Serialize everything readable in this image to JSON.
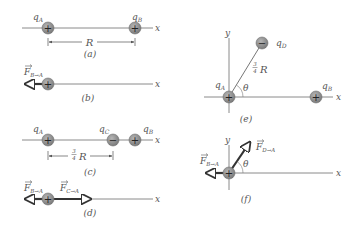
{
  "panels": {
    "a": {
      "caption": "(a)",
      "axis_label": "x",
      "charges": [
        {
          "name": "q",
          "sub": "A",
          "sign": "+"
        },
        {
          "name": "q",
          "sub": "B",
          "sign": "+"
        }
      ],
      "distance_label": "R"
    },
    "b": {
      "caption": "(b)",
      "axis_label": "x",
      "charge": {
        "sign": "+"
      },
      "force": {
        "name": "F",
        "sub": "B→A"
      }
    },
    "c": {
      "caption": "(c)",
      "axis_label": "x",
      "charges": [
        {
          "name": "q",
          "sub": "A",
          "sign": "+"
        },
        {
          "name": "q",
          "sub": "C",
          "sign": "−"
        },
        {
          "name": "q",
          "sub": "B",
          "sign": "+"
        }
      ],
      "distance_num": "3",
      "distance_den": "4",
      "distance_label": "R"
    },
    "d": {
      "caption": "(d)",
      "axis_label": "x",
      "charge": {
        "sign": "+"
      },
      "forces": [
        {
          "name": "F",
          "sub": "B→A"
        },
        {
          "name": "F",
          "sub": "C→A"
        }
      ]
    },
    "e": {
      "caption": "(e)",
      "x_label": "x",
      "y_label": "y",
      "charges": [
        {
          "name": "q",
          "sub": "A",
          "sign": "+"
        },
        {
          "name": "q",
          "sub": "D",
          "sign": "−"
        },
        {
          "name": "q",
          "sub": "B",
          "sign": "+"
        }
      ],
      "distance_num": "3",
      "distance_den": "4",
      "distance_label": "R",
      "angle_label": "θ"
    },
    "f": {
      "caption": "(f)",
      "x_label": "x",
      "y_label": "y",
      "charge": {
        "sign": "+"
      },
      "forces": [
        {
          "name": "F",
          "sub": "B→A"
        },
        {
          "name": "F",
          "sub": "D→A"
        }
      ],
      "angle_label": "θ"
    }
  },
  "colors": {
    "charge_fill": "#8c8c8c",
    "charge_edge": "#6e6e6e",
    "axis": "#8a8a8a",
    "force_arrow": "#333333",
    "text": "#555555"
  }
}
